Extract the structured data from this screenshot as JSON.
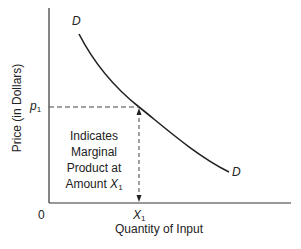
{
  "diagram": {
    "type": "marginal-product-demand-curve",
    "y_axis_label": "Price (in Dollars)",
    "x_axis_label": "Quantity of Input",
    "origin_label": "0",
    "price_label": {
      "symbol": "p",
      "subscript": "1"
    },
    "quantity_label": {
      "symbol": "X",
      "subscript": "1"
    },
    "curve_label_top": "D",
    "curve_label_bottom": "D",
    "annotation": {
      "line1": "Indicates",
      "line2": "Marginal",
      "line3": "Product at",
      "line4_prefix": "Amount ",
      "line4_symbol": "X",
      "line4_subscript": "1"
    },
    "colors": {
      "line": "#222222",
      "background": "#ffffff"
    }
  }
}
